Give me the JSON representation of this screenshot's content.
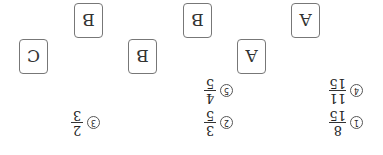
{
  "cards": [
    "A",
    "A",
    "B",
    "B",
    "B",
    "C"
  ],
  "options": [
    {
      "marker": "1",
      "numerator": "8",
      "denominator": "15"
    },
    {
      "marker": "2",
      "numerator": "3",
      "denominator": "5"
    },
    {
      "marker": "3",
      "numerator": "2",
      "denominator": "3"
    },
    {
      "marker": "4",
      "numerator": "11",
      "denominator": "15"
    },
    {
      "marker": "5",
      "numerator": "4",
      "denominator": "5"
    }
  ]
}
